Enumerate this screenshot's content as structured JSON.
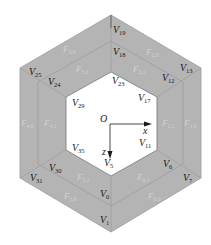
{
  "figure": {
    "colors": {
      "ring_fill": "#b4b4b4",
      "ring_edge": "#9a9a9a",
      "inner_fill": "#ffffff",
      "vertex_text": "#1a1a1a",
      "face_text": "#d2d2d2",
      "axis": "#1a1a1a"
    },
    "axes": {
      "origin": "O",
      "x": "x",
      "z": "z"
    },
    "vertices": [
      {
        "id": "V19",
        "base": "V",
        "sub": "19"
      },
      {
        "id": "V18",
        "base": "V",
        "sub": "18"
      },
      {
        "id": "V23",
        "base": "V",
        "sub": "23"
      },
      {
        "id": "V25",
        "base": "V",
        "sub": "25"
      },
      {
        "id": "V24",
        "base": "V",
        "sub": "24"
      },
      {
        "id": "V29",
        "base": "V",
        "sub": "29"
      },
      {
        "id": "V13",
        "base": "V",
        "sub": "13"
      },
      {
        "id": "V12",
        "base": "V",
        "sub": "12"
      },
      {
        "id": "V17",
        "base": "V",
        "sub": "17"
      },
      {
        "id": "V35",
        "base": "V",
        "sub": "35"
      },
      {
        "id": "V30",
        "base": "V",
        "sub": "30"
      },
      {
        "id": "V31",
        "base": "V",
        "sub": "31"
      },
      {
        "id": "V11",
        "base": "V",
        "sub": "11"
      },
      {
        "id": "V6",
        "base": "V",
        "sub": "6"
      },
      {
        "id": "V7",
        "base": "V",
        "sub": "7"
      },
      {
        "id": "V5",
        "base": "V",
        "sub": "5"
      },
      {
        "id": "V0",
        "base": "V",
        "sub": "0"
      },
      {
        "id": "V1",
        "base": "V",
        "sub": "1"
      }
    ],
    "faces": [
      {
        "id": "F3,0",
        "base": "F",
        "sub": "3,0"
      },
      {
        "id": "F3,1",
        "base": "F",
        "sub": "3,1"
      },
      {
        "id": "F2,0",
        "base": "F",
        "sub": "2,0"
      },
      {
        "id": "F2,1",
        "base": "F",
        "sub": "2,1"
      },
      {
        "id": "F4,0",
        "base": "F",
        "sub": "4,0"
      },
      {
        "id": "F4,1",
        "base": "F",
        "sub": "4,1"
      },
      {
        "id": "F1,1",
        "base": "F",
        "sub": "1,1"
      },
      {
        "id": "F1,0",
        "base": "F",
        "sub": "1,0"
      },
      {
        "id": "F5,1",
        "base": "F",
        "sub": "5,1"
      },
      {
        "id": "F5,0",
        "base": "F",
        "sub": "5,0"
      },
      {
        "id": "F0,1",
        "base": "F",
        "sub": "0,1"
      },
      {
        "id": "F0,0",
        "base": "F",
        "sub": "0,0"
      }
    ]
  }
}
